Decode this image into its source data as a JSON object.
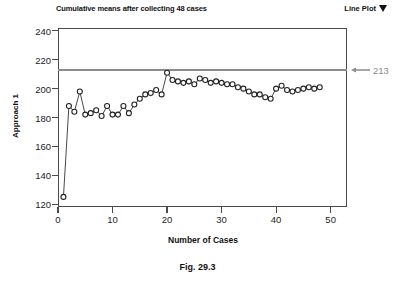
{
  "header": {
    "title": "Cumulative means after collecting 48 cases",
    "plot_type_label": "Line Plot",
    "plot_type_caret_icon": "chevron-down-icon"
  },
  "caption": "Fig. 29.3",
  "colors": {
    "line": "#333333",
    "marker_fill": "#ffffff",
    "marker_stroke": "#222222",
    "reference_line": "#8c8c8c",
    "axis": "#4a4a4a",
    "text": "#111111"
  },
  "annotations": [
    {
      "name": "reference-value-label",
      "text": "213",
      "value": 213,
      "arrow_icon": "arrow-left-icon"
    }
  ],
  "chart_data": {
    "type": "line",
    "title": "Cumulative means after collecting 48 cases",
    "xlabel": "Number of Cases",
    "ylabel": "Approach 1",
    "xlim": [
      0,
      53
    ],
    "ylim": [
      118,
      242
    ],
    "xticks": [
      0,
      10,
      20,
      30,
      40,
      50
    ],
    "yticks": [
      120,
      140,
      160,
      180,
      200,
      220,
      240
    ],
    "xtick_labels": [
      "0",
      "10",
      "20",
      "30",
      "40",
      "50"
    ],
    "ytick_labels": [
      "120",
      "140",
      "160",
      "180",
      "200",
      "220",
      "240"
    ],
    "grid": false,
    "legend": null,
    "marker": "open-circle",
    "reference_lines": [
      {
        "orientation": "horizontal",
        "y": 213,
        "label": "213",
        "color": "#8c8c8c"
      }
    ],
    "x": [
      1,
      2,
      3,
      4,
      5,
      6,
      7,
      8,
      9,
      10,
      11,
      12,
      13,
      14,
      15,
      16,
      17,
      18,
      19,
      20,
      21,
      22,
      23,
      24,
      25,
      26,
      27,
      28,
      29,
      30,
      31,
      32,
      33,
      34,
      35,
      36,
      37,
      38,
      39,
      40,
      41,
      42,
      43,
      44,
      45,
      46,
      47,
      48
    ],
    "y": [
      125,
      188,
      184,
      198,
      182,
      183,
      185,
      181,
      188,
      182,
      182,
      188,
      183,
      189,
      193,
      196,
      197,
      199,
      196,
      211,
      206,
      205,
      204,
      205,
      203,
      207,
      206,
      204,
      205,
      204,
      203,
      203,
      201,
      200,
      198,
      196,
      196,
      194,
      193,
      200,
      202,
      199,
      198,
      199,
      200,
      201,
      200,
      201
    ],
    "series": [
      {
        "name": "Approach 1 cumulative mean",
        "x": [
          1,
          2,
          3,
          4,
          5,
          6,
          7,
          8,
          9,
          10,
          11,
          12,
          13,
          14,
          15,
          16,
          17,
          18,
          19,
          20,
          21,
          22,
          23,
          24,
          25,
          26,
          27,
          28,
          29,
          30,
          31,
          32,
          33,
          34,
          35,
          36,
          37,
          38,
          39,
          40,
          41,
          42,
          43,
          44,
          45,
          46,
          47,
          48
        ],
        "values": [
          125,
          188,
          184,
          198,
          182,
          183,
          185,
          181,
          188,
          182,
          182,
          188,
          183,
          189,
          193,
          196,
          197,
          199,
          196,
          211,
          206,
          205,
          204,
          205,
          203,
          207,
          206,
          204,
          205,
          204,
          203,
          203,
          201,
          200,
          198,
          196,
          196,
          194,
          193,
          200,
          202,
          199,
          198,
          199,
          200,
          201,
          200,
          201
        ]
      }
    ]
  }
}
